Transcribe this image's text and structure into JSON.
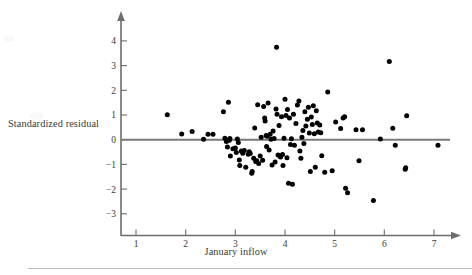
{
  "figure": {
    "x_axis_label": "January inflow",
    "y_axis_label": "Standardized residual",
    "x_ticklabels": [
      "1",
      "2",
      "3",
      "4",
      "5",
      "6",
      "7"
    ],
    "y_ticklabels": [
      "4",
      "3",
      "2",
      "1",
      "0",
      "−1",
      "−2",
      "−3"
    ],
    "point_color": "#000000",
    "axis_color": "#6d6d6d",
    "zero_line_color": "#7a7a7a",
    "background_color": "#ffffff"
  },
  "chart_data": {
    "type": "scatter",
    "title": "",
    "xlabel": "January inflow",
    "ylabel": "Standardized residual",
    "xlim": [
      0.75,
      7.35
    ],
    "ylim": [
      -3.45,
      4.45
    ],
    "xticks": [
      1,
      2,
      3,
      4,
      5,
      6,
      7
    ],
    "yticks": [
      4,
      3,
      2,
      1,
      0,
      -1,
      -2,
      -3
    ],
    "grid": false,
    "legend": null,
    "reference_lines": [
      {
        "type": "horizontal",
        "y": 0,
        "color": "#7a7a7a",
        "label": ""
      }
    ],
    "series": [
      {
        "name": "Standardized residuals",
        "marker": "filled-circle",
        "color": "#000000",
        "points": [
          [
            1.63,
            1.01
          ],
          [
            1.92,
            0.23
          ],
          [
            2.13,
            0.33
          ],
          [
            2.36,
            0.02
          ],
          [
            2.45,
            0.22
          ],
          [
            2.55,
            0.22
          ],
          [
            2.76,
            1.13
          ],
          [
            2.79,
            0.06
          ],
          [
            2.82,
            -0.07
          ],
          [
            2.84,
            -0.3
          ],
          [
            2.86,
            1.52
          ],
          [
            2.88,
            -0.02
          ],
          [
            2.89,
            0.05
          ],
          [
            2.9,
            -0.66
          ],
          [
            2.95,
            -0.37
          ],
          [
            3.0,
            -0.34
          ],
          [
            3.02,
            -0.52
          ],
          [
            3.04,
            0.03
          ],
          [
            3.06,
            -0.11
          ],
          [
            3.08,
            -0.82
          ],
          [
            3.09,
            -1.04
          ],
          [
            3.12,
            -0.46
          ],
          [
            3.15,
            -0.55
          ],
          [
            3.18,
            -0.44
          ],
          [
            3.21,
            -1.12
          ],
          [
            3.26,
            -0.59
          ],
          [
            3.28,
            -0.49
          ],
          [
            3.3,
            -0.56
          ],
          [
            3.33,
            -1.36
          ],
          [
            3.34,
            -1.29
          ],
          [
            3.37,
            -0.75
          ],
          [
            3.39,
            0.47
          ],
          [
            3.41,
            -0.88
          ],
          [
            3.43,
            -0.85
          ],
          [
            3.45,
            1.42
          ],
          [
            3.47,
            -0.96
          ],
          [
            3.5,
            -0.66
          ],
          [
            3.52,
            0.1
          ],
          [
            3.55,
            -0.83
          ],
          [
            3.57,
            1.34
          ],
          [
            3.59,
            0.88
          ],
          [
            3.6,
            0.76
          ],
          [
            3.62,
            0.17
          ],
          [
            3.63,
            -0.28
          ],
          [
            3.64,
            0.14
          ],
          [
            3.66,
            1.49
          ],
          [
            3.68,
            -0.42
          ],
          [
            3.7,
            0.22
          ],
          [
            3.72,
            0.02
          ],
          [
            3.74,
            -1.02
          ],
          [
            3.76,
            0.35
          ],
          [
            3.78,
            0.05
          ],
          [
            3.8,
            -0.9
          ],
          [
            3.82,
            1.24
          ],
          [
            3.83,
            3.74
          ],
          [
            3.84,
            1.03
          ],
          [
            3.86,
            -0.62
          ],
          [
            3.88,
            0.57
          ],
          [
            3.9,
            -0.66
          ],
          [
            3.91,
            -0.7
          ],
          [
            3.93,
            0.93
          ],
          [
            3.95,
            -0.6
          ],
          [
            3.96,
            -1.04
          ],
          [
            3.98,
            0.06
          ],
          [
            4.0,
            1.64
          ],
          [
            4.02,
            0.98
          ],
          [
            4.04,
            -0.73
          ],
          [
            4.05,
            1.22
          ],
          [
            4.07,
            -1.76
          ],
          [
            4.09,
            0.88
          ],
          [
            4.11,
            -0.19
          ],
          [
            4.13,
            0.04
          ],
          [
            4.15,
            -1.8
          ],
          [
            4.17,
            1.03
          ],
          [
            4.19,
            -0.22
          ],
          [
            4.22,
            0.66
          ],
          [
            4.25,
            1.4
          ],
          [
            4.28,
            1.57
          ],
          [
            4.3,
            -0.46
          ],
          [
            4.32,
            -0.75
          ],
          [
            4.34,
            0.1
          ],
          [
            4.36,
            0.37
          ],
          [
            4.38,
            -0.15
          ],
          [
            4.4,
            1.13
          ],
          [
            4.42,
            0.55
          ],
          [
            4.45,
            0.83
          ],
          [
            4.47,
            1.31
          ],
          [
            4.49,
            0.27
          ],
          [
            4.51,
            -1.29
          ],
          [
            4.53,
            0.92
          ],
          [
            4.55,
            0.62
          ],
          [
            4.57,
            1.37
          ],
          [
            4.59,
            0.24
          ],
          [
            4.61,
            -1.12
          ],
          [
            4.63,
            1.17
          ],
          [
            4.65,
            0.68
          ],
          [
            4.67,
            0.31
          ],
          [
            4.7,
            0.6
          ],
          [
            4.72,
            0.28
          ],
          [
            4.74,
            -0.65
          ],
          [
            4.8,
            -1.32
          ],
          [
            4.86,
            1.93
          ],
          [
            4.95,
            -1.26
          ],
          [
            5.02,
            0.72
          ],
          [
            5.12,
            0.45
          ],
          [
            5.17,
            0.88
          ],
          [
            5.2,
            0.93
          ],
          [
            5.22,
            -1.97
          ],
          [
            5.26,
            -2.15
          ],
          [
            5.43,
            0.4
          ],
          [
            5.49,
            -0.85
          ],
          [
            5.56,
            0.4
          ],
          [
            5.78,
            -2.46
          ],
          [
            5.92,
            0.03
          ],
          [
            6.1,
            3.17
          ],
          [
            6.17,
            0.46
          ],
          [
            6.22,
            -0.22
          ],
          [
            6.42,
            -1.2
          ],
          [
            6.43,
            -1.14
          ],
          [
            6.45,
            0.97
          ],
          [
            7.08,
            -0.22
          ]
        ]
      }
    ]
  }
}
